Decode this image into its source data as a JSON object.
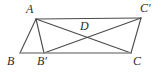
{
  "figure": {
    "type": "geometry-diagram",
    "background_color": "#ffffff",
    "stroke_color": "#4a4a4a",
    "baseline_color": "#8d8d8d",
    "label_color": "#2b2b2b",
    "points": {
      "A": {
        "label": "A",
        "x": 36,
        "y": 19,
        "label_x": 26,
        "label_y": 3
      },
      "B": {
        "label": "B",
        "x": 20,
        "y": 53,
        "label_x": 7,
        "label_y": 55
      },
      "Bp": {
        "label": "B′",
        "x": 44,
        "y": 53,
        "label_x": 37,
        "label_y": 55
      },
      "C": {
        "label": "C",
        "x": 131,
        "y": 53,
        "label_x": 133,
        "label_y": 55
      },
      "Cp": {
        "label": "C′",
        "x": 141,
        "y": 18,
        "label_x": 140,
        "label_y": 2
      },
      "D": {
        "label": "D",
        "x": 88,
        "y": 36,
        "label_x": 80,
        "label_y": 20
      }
    },
    "segments": [
      {
        "name": "segment-A-Cprime",
        "from": "A",
        "to": "Cp",
        "style": "solid"
      },
      {
        "name": "segment-A-B",
        "from": "A",
        "to": "B",
        "style": "solid"
      },
      {
        "name": "segment-A-Bprime",
        "from": "A",
        "to": "Bp",
        "style": "solid"
      },
      {
        "name": "segment-A-C",
        "from": "A",
        "to": "C",
        "style": "solid"
      },
      {
        "name": "segment-Bprime-Cprime",
        "from": "Bp",
        "to": "Cp",
        "style": "solid"
      },
      {
        "name": "segment-C-Cprime",
        "from": "C",
        "to": "Cp",
        "style": "solid"
      },
      {
        "name": "segment-B-C",
        "from": "B",
        "to": "C",
        "style": "baseline"
      }
    ]
  }
}
